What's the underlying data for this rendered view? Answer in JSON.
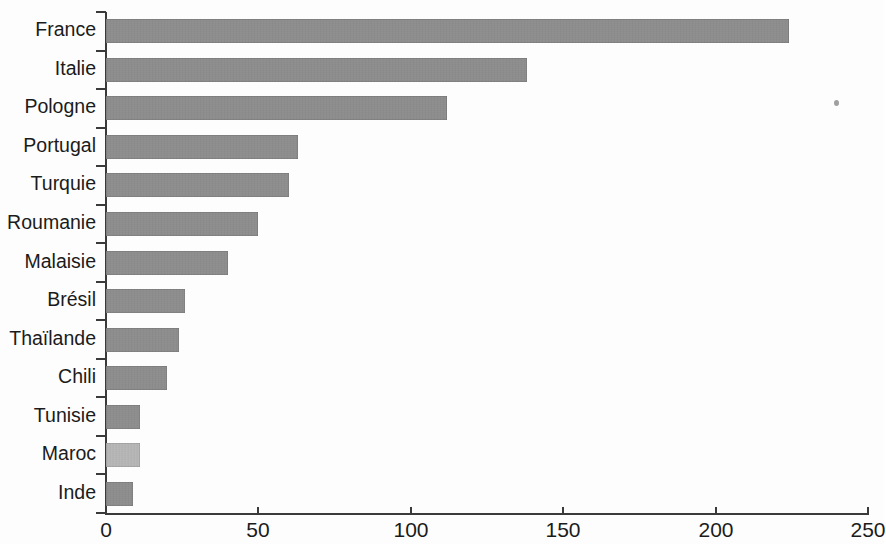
{
  "chart_data": {
    "type": "bar",
    "orientation": "horizontal",
    "title": "",
    "subtitle": "",
    "xlabel": "",
    "ylabel": "",
    "xlim": [
      0,
      250
    ],
    "ylim": null,
    "grid": false,
    "legend": null,
    "xticks": [
      "0",
      "50",
      "100",
      "150",
      "200",
      "250"
    ],
    "xtick_values": [
      0,
      50,
      100,
      150,
      200,
      250
    ],
    "categories": [
      "France",
      "Italie",
      "Pologne",
      "Portugal",
      "Turquie",
      "Roumanie",
      "Malaisie",
      "Brésil",
      "Thaïlande",
      "Chili",
      "Tunisie",
      "Maroc",
      "Inde"
    ],
    "values": [
      224,
      138,
      112,
      63,
      60,
      50,
      40,
      26,
      24,
      20,
      11,
      11,
      9
    ],
    "bar_colors": [
      "#8d8d8d",
      "#8d8d8d",
      "#8d8d8d",
      "#8d8d8d",
      "#8d8d8d",
      "#8d8d8d",
      "#8d8d8d",
      "#8d8d8d",
      "#8d8d8d",
      "#8d8d8d",
      "#8d8d8d",
      "#bdbdbd",
      "#8d8d8d"
    ],
    "accent_color": "#8d8d8d",
    "highlight_color": "#bdbdbd",
    "axis_color": "#3a3a3a",
    "background_color": "#fdfdfd"
  },
  "artifacts": {
    "speck_label": "scan-speck"
  }
}
